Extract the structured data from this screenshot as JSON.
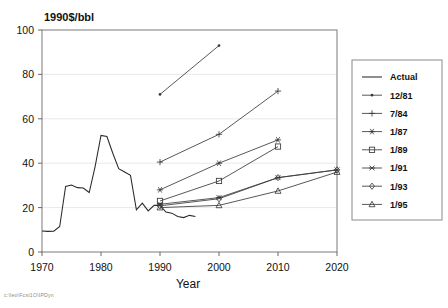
{
  "chart_data": {
    "type": "line",
    "title": "1990$/bbl",
    "xlabel": "Year",
    "ylabel": "1990$/bbl",
    "xlim": [
      1970,
      2020
    ],
    "ylim": [
      0,
      100
    ],
    "xticks": [
      1970,
      1980,
      1990,
      2000,
      2010,
      2020
    ],
    "yticks": [
      0,
      20,
      40,
      60,
      80,
      100
    ],
    "grid": true,
    "legend_position": "right-outside",
    "series": [
      {
        "name": "Actual",
        "marker": "none",
        "x": [
          1970,
          1971,
          1972,
          1973,
          1974,
          1975,
          1976,
          1977,
          1978,
          1979,
          1980,
          1981,
          1982,
          1983,
          1984,
          1985,
          1986,
          1987,
          1988,
          1989,
          1990,
          1991,
          1992,
          1993,
          1994,
          1995,
          1996
        ],
        "values": [
          9.5,
          9.3,
          9.4,
          11.5,
          29.5,
          30.2,
          29.0,
          28.8,
          26.8,
          38.5,
          52.5,
          52.0,
          44.5,
          37.5,
          36.0,
          34.5,
          19.0,
          22.0,
          18.5,
          21.0,
          21.0,
          18.0,
          17.5,
          16.0,
          15.5,
          16.5,
          16.0
        ]
      },
      {
        "name": "12/81",
        "marker": "dot",
        "x": [
          1990,
          2000
        ],
        "values": [
          71.0,
          93.0
        ]
      },
      {
        "name": "7/84",
        "marker": "plus",
        "x": [
          1990,
          2000,
          2010
        ],
        "values": [
          40.5,
          53.0,
          72.5
        ]
      },
      {
        "name": "1/87",
        "marker": "asterisk",
        "x": [
          1990,
          2000,
          2010
        ],
        "values": [
          28.0,
          40.0,
          50.5
        ]
      },
      {
        "name": "1/89",
        "marker": "square",
        "x": [
          1990,
          2000,
          2010
        ],
        "values": [
          23.0,
          32.0,
          47.5
        ]
      },
      {
        "name": "1/91",
        "marker": "cross",
        "x": [
          1990,
          2000,
          2010,
          2020
        ],
        "values": [
          21.5,
          24.5,
          33.5,
          37.0
        ]
      },
      {
        "name": "1/93",
        "marker": "diamond",
        "x": [
          1990,
          2000,
          2010,
          2020
        ],
        "values": [
          20.8,
          24.0,
          33.5,
          37.0
        ]
      },
      {
        "name": "1/95",
        "marker": "triangle",
        "x": [
          1990,
          2000,
          2010,
          2020
        ],
        "values": [
          20.0,
          21.0,
          27.5,
          36.0
        ]
      }
    ]
  },
  "legend": {
    "entries": [
      {
        "label": "Actual",
        "marker": "none"
      },
      {
        "label": "12/81",
        "marker": "dot"
      },
      {
        "label": "7/84",
        "marker": "plus"
      },
      {
        "label": "1/87",
        "marker": "asterisk"
      },
      {
        "label": "1/89",
        "marker": "square"
      },
      {
        "label": "1/91",
        "marker": "cross"
      },
      {
        "label": "1/93",
        "marker": "diamond"
      },
      {
        "label": "1/95",
        "marker": "triangle"
      }
    ]
  },
  "footer": {
    "path_text": "c:\\leo\\Fcst1O\\IPDyn"
  },
  "colors": {
    "line": "#3a3a3a",
    "grid": "#e2e2e2",
    "frame": "#7a7a7a",
    "text": "#111111",
    "footer": "#8d8d8d"
  }
}
